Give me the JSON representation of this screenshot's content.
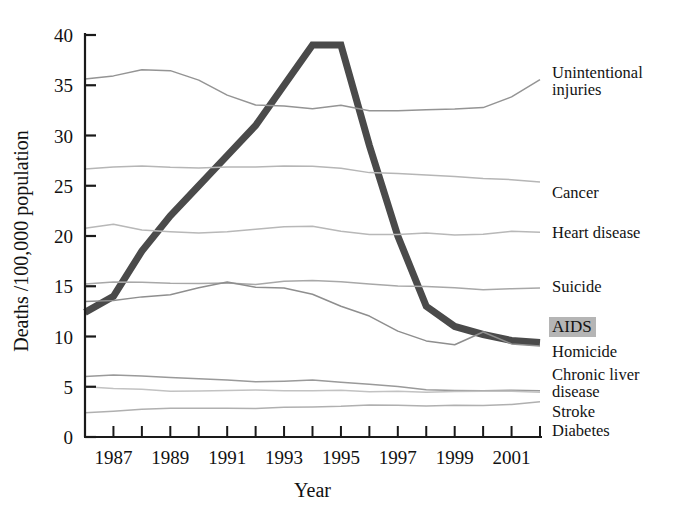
{
  "chart_data": {
    "type": "line",
    "title": "",
    "xlabel": "Year",
    "ylabel": "Deaths /100,000 population",
    "xlim": [
      1986,
      2002
    ],
    "ylim": [
      0,
      40
    ],
    "yticks": [
      0,
      5,
      10,
      15,
      20,
      25,
      30,
      35,
      40
    ],
    "xticks": [
      1987,
      1989,
      1991,
      1993,
      1995,
      1997,
      1999,
      2001
    ],
    "xticks_minor": [
      1986,
      1988,
      1990,
      1992,
      1994,
      1996,
      1998,
      2000,
      2002
    ],
    "x": [
      1986,
      1987,
      1988,
      1989,
      1990,
      1991,
      1992,
      1993,
      1994,
      1995,
      1996,
      1997,
      1998,
      1999,
      2000,
      2001,
      2002
    ],
    "grid": false,
    "legend_position": "right-inline",
    "highlight_series": "AIDS",
    "series": [
      {
        "name": "AIDS",
        "label": "AIDS",
        "color": "#4a4a4a",
        "width": 7,
        "values": [
          12.4,
          14.0,
          18.5,
          22.0,
          25.0,
          28.0,
          31.0,
          35.0,
          39.0,
          39.0,
          29.0,
          20.0,
          13.0,
          11.0,
          10.2,
          9.6,
          9.4
        ]
      },
      {
        "name": "Unintentional injuries",
        "label": "Unintentional\ninjuries",
        "color": "#949494",
        "width": 1.5,
        "values": [
          35.6,
          35.9,
          36.5,
          36.4,
          35.5,
          34.0,
          33.0,
          32.9,
          32.7,
          33.0,
          32.5,
          32.5,
          32.6,
          32.7,
          32.8,
          33.8,
          35.5
        ]
      },
      {
        "name": "Cancer",
        "label": "Cancer",
        "color": "#b6b6b6",
        "width": 1.5,
        "values": [
          26.6,
          26.9,
          27.0,
          26.9,
          26.8,
          26.9,
          26.9,
          27.0,
          26.9,
          26.7,
          26.3,
          26.2,
          26.0,
          25.9,
          25.7,
          25.6,
          25.4
        ]
      },
      {
        "name": "Heart disease",
        "label": "Heart disease",
        "color": "#b8b8b8",
        "width": 1.5,
        "values": [
          20.8,
          21.2,
          20.6,
          20.4,
          20.3,
          20.4,
          20.6,
          20.9,
          20.9,
          20.5,
          20.2,
          20.2,
          20.3,
          20.1,
          20.2,
          20.5,
          20.4
        ]
      },
      {
        "name": "Suicide",
        "label": "Suicide",
        "color": "#a8a8a8",
        "width": 1.5,
        "values": [
          15.2,
          15.4,
          15.4,
          15.3,
          15.3,
          15.4,
          15.2,
          15.5,
          15.6,
          15.5,
          15.2,
          15.0,
          14.9,
          14.8,
          14.6,
          14.7,
          14.8
        ]
      },
      {
        "name": "Homicide",
        "label": "Homicide",
        "color": "#8e8e8e",
        "width": 1.5,
        "values": [
          13.5,
          13.6,
          14.0,
          14.1,
          14.8,
          15.4,
          14.9,
          14.8,
          14.2,
          13.0,
          12.0,
          10.6,
          9.6,
          9.2,
          10.5,
          9.3,
          9.1
        ]
      },
      {
        "name": "Chronic liver disease",
        "label": "Chronic liver\ndisease",
        "color": "#9a9a9a",
        "width": 1.5,
        "values": [
          6.0,
          6.1,
          6.0,
          5.9,
          5.8,
          5.7,
          5.5,
          5.6,
          5.7,
          5.5,
          5.3,
          5.0,
          4.7,
          4.6,
          4.6,
          4.6,
          4.6
        ]
      },
      {
        "name": "Stroke",
        "label": "Stroke",
        "color": "#c2c2c2",
        "width": 1.5,
        "values": [
          5.0,
          4.9,
          4.8,
          4.6,
          4.6,
          4.6,
          4.6,
          4.6,
          4.6,
          4.6,
          4.5,
          4.5,
          4.5,
          4.6,
          4.6,
          4.6,
          4.5
        ]
      },
      {
        "name": "Diabetes",
        "label": "Diabetes",
        "color": "#b0b0b0",
        "width": 1.5,
        "values": [
          2.4,
          2.5,
          2.7,
          2.8,
          2.8,
          2.9,
          2.9,
          3.0,
          3.0,
          3.1,
          3.2,
          3.2,
          3.1,
          3.1,
          3.1,
          3.2,
          3.5
        ]
      }
    ]
  },
  "axes": {
    "y_title": "Deaths /100,000 population",
    "x_title": "Year",
    "y_tick_labels": [
      "0",
      "5",
      "10",
      "15",
      "20",
      "25",
      "30",
      "35",
      "40"
    ],
    "x_tick_labels": [
      "1987",
      "1989",
      "1991",
      "1993",
      "1995",
      "1997",
      "1999",
      "2001"
    ]
  },
  "legend": {
    "unintentional_line1": "Unintentional",
    "unintentional_line2": "injuries",
    "cancer": "Cancer",
    "heart_disease": "Heart disease",
    "suicide": "Suicide",
    "aids": "AIDS",
    "homicide": "Homicide",
    "chronic_liver_line1": "Chronic liver",
    "chronic_liver_line2": "disease",
    "stroke": "Stroke",
    "diabetes": "Diabetes"
  },
  "colors": {
    "aids_line": "#4a4a4a",
    "axis": "#1a1a1a",
    "highlight_bg": "#b5b5b5",
    "background": "#ffffff"
  }
}
